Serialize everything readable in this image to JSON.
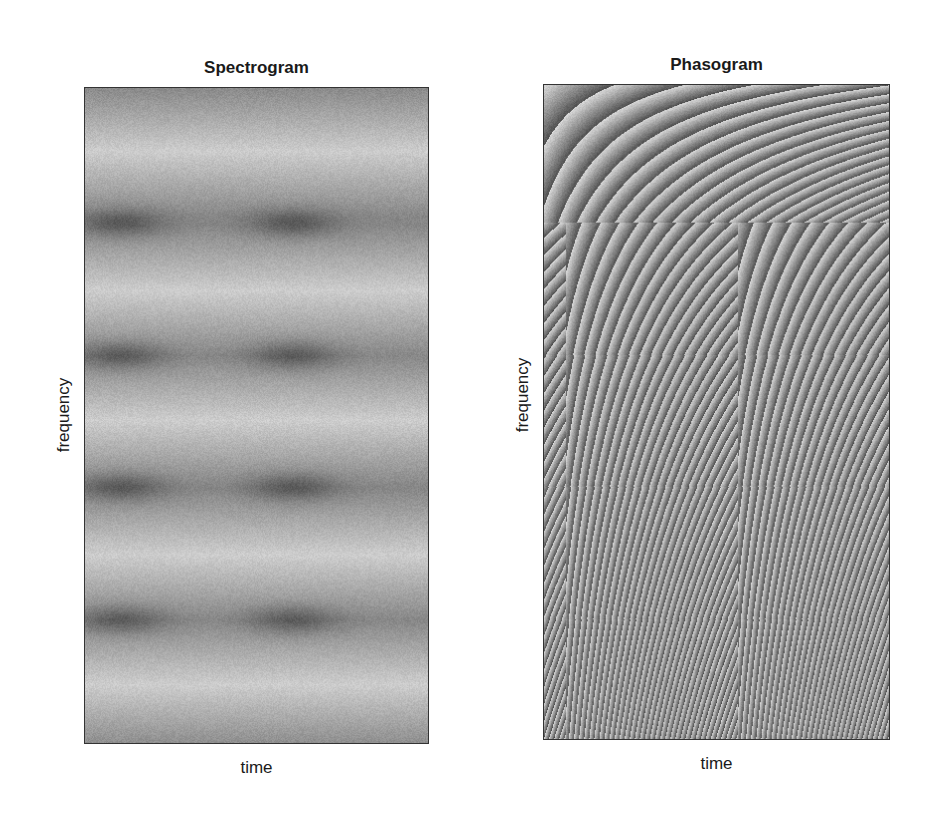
{
  "chart_data": [
    {
      "type": "heatmap",
      "title": "Spectrogram",
      "xlabel": "time",
      "ylabel": "frequency",
      "grid": false,
      "colormap": "grayscale",
      "frame": {
        "left": 84,
        "top": 87,
        "width": 345,
        "height": 657
      },
      "atoms": {
        "time_centers_px": [
          120,
          293
        ],
        "frequency_centers_px": [
          222,
          355,
          487,
          620
        ]
      },
      "light_bands_px": [
        150,
        290,
        420,
        555,
        685
      ],
      "description": "Horizontal alternating light/dark bands; dark energy minima spots at 2 time positions x 4 frequency positions"
    },
    {
      "type": "heatmap",
      "title": "Phasogram",
      "xlabel": "time",
      "ylabel": "frequency",
      "grid": false,
      "colormap": "grayscale (wrapped phase)",
      "frame": {
        "left": 543,
        "top": 84,
        "width": 347,
        "height": 656
      },
      "atoms": {
        "time_centers_px": [
          565,
          738
        ],
        "band_boundaries_px": [
          222,
          355,
          487,
          620
        ]
      },
      "description": "Wrapped phase stripes curving down-right, narrowing toward bottom; pattern repeats at two time positions"
    }
  ],
  "panels": {
    "left": {
      "title": "Spectrogram",
      "xlabel": "time",
      "ylabel": "frequency"
    },
    "right": {
      "title": "Phasogram",
      "xlabel": "time",
      "ylabel": "frequency"
    }
  }
}
